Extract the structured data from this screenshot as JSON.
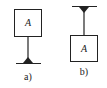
{
  "diagrams": [
    {
      "id": "a",
      "caption": "a)",
      "box_label": "A",
      "support": "bottom",
      "description": "Box A mounted on a vertical rod fixed to a support below"
    },
    {
      "id": "b",
      "caption": "b)",
      "box_label": "A",
      "support": "top",
      "description": "Box A suspended by a vertical rod from a support above"
    }
  ],
  "colors": {
    "stroke": "#222222",
    "background": "#ffffff"
  }
}
